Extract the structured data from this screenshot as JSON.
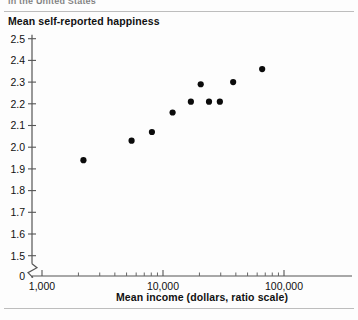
{
  "figure": {
    "cut_caption": "in the United States",
    "y_axis_title": "Mean self-reported happiness",
    "x_axis_title": "Mean income (dollars, ratio scale)"
  },
  "chart_data": {
    "type": "scatter",
    "title": "",
    "subtitle": "",
    "xlabel": "Mean income (dollars, ratio scale)",
    "ylabel": "Mean self-reported happiness",
    "xscale": "log",
    "yscale": "linear",
    "xlim": [
      1000,
      100000
    ],
    "ylim": [
      1.5,
      2.5
    ],
    "y_axis_break": true,
    "y_break_label": "0",
    "grid": false,
    "legend": null,
    "x_ticks_major": [
      1000,
      10000,
      100000
    ],
    "x_tick_labels": [
      "1,000",
      "10,000",
      "100,000"
    ],
    "y_ticks": [
      2.5,
      2.4,
      2.3,
      2.2,
      2.1,
      2.0,
      1.9,
      1.8,
      1.7,
      1.6,
      1.5
    ],
    "y_tick_labels": [
      "2.5",
      "2.4",
      "2.3",
      "2.2",
      "2.1",
      "2.0",
      "1.9",
      "1.8",
      "1.7",
      "1.6",
      "1.5"
    ],
    "marker": "filled-circle",
    "marker_color": "#0b0b0b",
    "points": [
      {
        "x": 2200,
        "y": 1.94
      },
      {
        "x": 5500,
        "y": 2.03
      },
      {
        "x": 8100,
        "y": 2.07
      },
      {
        "x": 12000,
        "y": 2.16
      },
      {
        "x": 17000,
        "y": 2.21
      },
      {
        "x": 20500,
        "y": 2.29
      },
      {
        "x": 24000,
        "y": 2.21
      },
      {
        "x": 29500,
        "y": 2.21
      },
      {
        "x": 38000,
        "y": 2.3
      },
      {
        "x": 66000,
        "y": 2.36
      }
    ]
  }
}
